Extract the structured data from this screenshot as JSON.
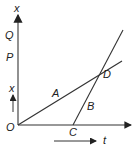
{
  "diagram": {
    "type": "position-time graph",
    "axes": {
      "vertical_label": "x",
      "horizontal_label": "t",
      "origin_label": "O",
      "vertical_marks": [
        "Q",
        "P"
      ]
    },
    "lines": [
      {
        "label": "A",
        "from": "O",
        "to_label_point": "D"
      },
      {
        "label": "B",
        "from": "C",
        "to_label_point": "D"
      }
    ],
    "points": {
      "intersection": "D",
      "start_B": "C"
    },
    "arrow_labels": {
      "x_arrow": "x",
      "t_arrow": "t"
    },
    "colors": {
      "line": "#333333",
      "background": "#ffffff"
    }
  }
}
